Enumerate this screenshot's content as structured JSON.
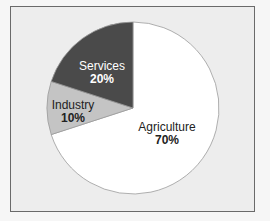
{
  "chart_data": {
    "type": "pie",
    "title": "",
    "categories": [
      "Agriculture",
      "Industry",
      "Services"
    ],
    "values": [
      70,
      10,
      20
    ],
    "labels": [
      "70%",
      "10%",
      "20%"
    ],
    "colors": [
      "#ffffff",
      "#c4c4c4",
      "#4a4a4a"
    ],
    "label_colors": [
      "#222222",
      "#222222",
      "#ffffff"
    ],
    "legend": "none (labels inside slices)"
  },
  "slices": [
    {
      "name": "Agriculture",
      "pct": "70%"
    },
    {
      "name": "Industry",
      "pct": "10%"
    },
    {
      "name": "Services",
      "pct": "20%"
    }
  ]
}
